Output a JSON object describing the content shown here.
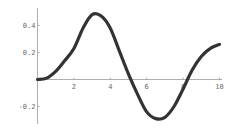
{
  "chart_data": {
    "type": "line",
    "title": "",
    "xlabel": "",
    "ylabel": "",
    "xlim": [
      0,
      10
    ],
    "ylim": [
      -0.33,
      0.5
    ],
    "grid": false,
    "legend": null,
    "x_ticks": [
      2,
      4,
      6,
      8,
      10
    ],
    "x_tick_labels": [
      "2",
      "4",
      "6",
      "8",
      "10"
    ],
    "y_ticks": [
      0.4,
      0.2,
      -0.2
    ],
    "y_tick_labels": [
      "0.4",
      "0.2",
      "-0.2"
    ],
    "series": [
      {
        "name": "f(x)",
        "color": "#333333",
        "x": [
          0,
          0.5,
          1,
          1.5,
          2,
          2.5,
          3,
          3.5,
          4,
          4.5,
          5,
          5.5,
          6,
          6.5,
          7,
          7.5,
          8,
          8.5,
          9,
          9.5,
          10
        ],
        "values": [
          0,
          0.01,
          0.06,
          0.14,
          0.23,
          0.38,
          0.48,
          0.47,
          0.38,
          0.21,
          0.04,
          -0.11,
          -0.24,
          -0.29,
          -0.28,
          -0.2,
          -0.07,
          0.07,
          0.17,
          0.23,
          0.26
        ]
      }
    ]
  },
  "colors": {
    "axis": "#9a9a9a",
    "curve": "#333333",
    "labels": "#6a6a6a"
  }
}
